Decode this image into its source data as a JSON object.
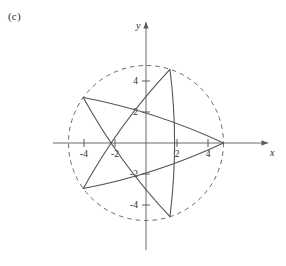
{
  "figure": {
    "panel_label": "(c)",
    "axis_labels": {
      "x": "x",
      "y": "y"
    },
    "stroke_color": "#55555a",
    "axis_color": "#666666",
    "text_color": "#2b2b2b",
    "background": "#ffffff"
  },
  "chart_data": {
    "type": "line",
    "title": "",
    "subtitle": "",
    "xlabel": "x",
    "ylabel": "y",
    "xlim": [
      -5.8,
      5.8
    ],
    "ylim": [
      -5.8,
      5.8
    ],
    "grid": false,
    "legend": null,
    "legend_position": "none",
    "xticks": [
      -4,
      -2,
      2,
      4
    ],
    "yticks": [
      -4,
      -2,
      2,
      4
    ],
    "xtick_labels": [
      "-4",
      "-2",
      "2",
      "4"
    ],
    "ytick_labels": [
      "-4",
      "-2",
      "2",
      "4"
    ],
    "annotations": [
      "(c)"
    ],
    "series": [
      {
        "name": "bounding-circle",
        "kind": "circle",
        "style": "dashed",
        "center": [
          0,
          0
        ],
        "radius": 5
      },
      {
        "name": "star-curve",
        "kind": "closed-curve",
        "style": "solid",
        "description": "five-pointed star traced by a polar curve whose tips lie on the radius-5 circle",
        "vertices": [
          [
            5.0,
            0.0
          ],
          [
            1.545,
            4.755
          ],
          [
            -4.045,
            2.939
          ],
          [
            -4.045,
            -2.939
          ],
          [
            1.545,
            -4.755
          ]
        ],
        "vertex_angles_deg": [
          0,
          72,
          144,
          216,
          288
        ],
        "vertex_radius": 5,
        "edge_order": [
          0,
          2,
          4,
          1,
          3
        ],
        "edge_bulge": 0.12
      }
    ]
  }
}
